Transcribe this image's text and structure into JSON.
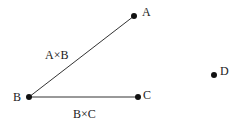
{
  "diagram": {
    "points": {
      "A": {
        "label": "A",
        "x": 134,
        "y": 16
      },
      "B": {
        "label": "B",
        "x": 29,
        "y": 97
      },
      "C": {
        "label": "C",
        "x": 138,
        "y": 97
      },
      "D": {
        "label": "D",
        "x": 214,
        "y": 75
      }
    },
    "edges": [
      {
        "from": "B",
        "to": "A",
        "label": "A×B"
      },
      {
        "from": "B",
        "to": "C",
        "label": "B×C"
      }
    ],
    "colors": {
      "line": "#333333",
      "point": "#111111",
      "text": "#222222"
    }
  }
}
